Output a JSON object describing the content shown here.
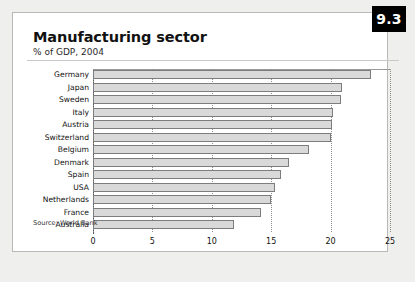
{
  "badge": {
    "label": "9.3"
  },
  "header": {
    "title": "Manufacturing sector",
    "subtitle": "% of GDP, 2004"
  },
  "footer": {
    "source": "Source: World Bank"
  },
  "chart_data": {
    "type": "bar",
    "orientation": "horizontal",
    "title": "Manufacturing sector",
    "subtitle": "% of GDP, 2004",
    "xlabel": "",
    "ylabel": "",
    "xlim": [
      0,
      25
    ],
    "xticks": [
      "0",
      "5",
      "10",
      "15",
      "20",
      "25"
    ],
    "grid": true,
    "legend": false,
    "series_name": "% of GDP",
    "categories": [
      "Germany",
      "Japan",
      "Sweden",
      "Italy",
      "Austria",
      "Switzerland",
      "Belgium",
      "Denmark",
      "Spain",
      "USA",
      "Netherlands",
      "France",
      "Australia"
    ],
    "values": [
      23.4,
      21.0,
      20.9,
      20.2,
      20.1,
      20.0,
      18.2,
      16.5,
      15.8,
      15.3,
      15.0,
      14.1,
      11.9
    ],
    "bar_color": "#d9d9d9",
    "bar_border_color": "#7d7d7d"
  }
}
